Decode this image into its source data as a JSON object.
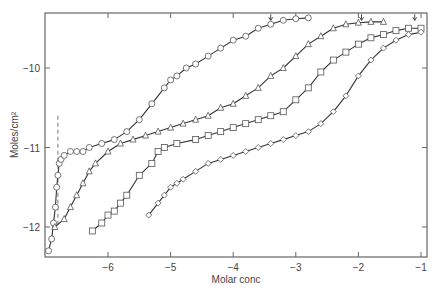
{
  "chart_data": {
    "type": "scatter",
    "title": "",
    "xlabel": "Molar conc",
    "ylabel": "Moles/cm²",
    "xlim": [
      -7.0,
      -0.9
    ],
    "ylim": [
      -12.35,
      -9.35
    ],
    "xticks": [
      -6,
      -5,
      -4,
      -3,
      -2,
      -1
    ],
    "xtick_labels": [
      "−6",
      "−5",
      "−4",
      "−3",
      "−2",
      "−1"
    ],
    "yticks": [
      -10,
      -11,
      -12
    ],
    "ytick_labels": [
      "−10",
      "−11",
      "−12"
    ],
    "grid": false,
    "legend": null,
    "annotations": [
      {
        "type": "dashed-vertical-line",
        "x": -6.8,
        "y_from": -10.6,
        "y_to": -12.0
      },
      {
        "type": "arrow-down",
        "x": -3.4,
        "y": -9.4
      },
      {
        "type": "arrow-down",
        "x": -1.95,
        "y": -9.4
      },
      {
        "type": "arrow-down",
        "x": -1.1,
        "y": -9.4
      }
    ],
    "series": [
      {
        "name": "series-1",
        "marker": "circle",
        "x": [
          -6.95,
          -6.9,
          -6.87,
          -6.84,
          -6.82,
          -6.8,
          -6.78,
          -6.75,
          -6.7,
          -6.6,
          -6.5,
          -6.4,
          -6.3,
          -6.1,
          -5.9,
          -5.7,
          -5.5,
          -5.3,
          -5.1,
          -5.0,
          -4.9,
          -4.75,
          -4.6,
          -4.4,
          -4.2,
          -4.0,
          -3.8,
          -3.6,
          -3.4,
          -3.2,
          -3.0,
          -2.8
        ],
        "y": [
          -12.3,
          -12.15,
          -11.95,
          -11.75,
          -11.5,
          -11.35,
          -11.2,
          -11.15,
          -11.1,
          -11.05,
          -11.05,
          -11.05,
          -11.0,
          -10.95,
          -10.9,
          -10.8,
          -10.65,
          -10.45,
          -10.25,
          -10.15,
          -10.1,
          -10.0,
          -9.95,
          -9.85,
          -9.75,
          -9.65,
          -9.6,
          -9.5,
          -9.45,
          -9.4,
          -9.38,
          -9.37
        ]
      },
      {
        "name": "series-2",
        "marker": "triangle",
        "x": [
          -6.85,
          -6.7,
          -6.6,
          -6.5,
          -6.4,
          -6.3,
          -6.2,
          -6.0,
          -5.8,
          -5.6,
          -5.4,
          -5.2,
          -5.0,
          -4.8,
          -4.6,
          -4.4,
          -4.2,
          -4.0,
          -3.8,
          -3.6,
          -3.4,
          -3.2,
          -3.0,
          -2.8,
          -2.6,
          -2.4,
          -2.2,
          -2.0,
          -1.8,
          -1.6
        ],
        "y": [
          -12.0,
          -11.9,
          -11.75,
          -11.6,
          -11.45,
          -11.3,
          -11.2,
          -11.05,
          -10.95,
          -10.9,
          -10.85,
          -10.8,
          -10.75,
          -10.7,
          -10.65,
          -10.6,
          -10.5,
          -10.45,
          -10.35,
          -10.25,
          -10.1,
          -10.0,
          -9.85,
          -9.7,
          -9.6,
          -9.5,
          -9.45,
          -9.43,
          -9.42,
          -9.42
        ]
      },
      {
        "name": "series-3",
        "marker": "square",
        "x": [
          -6.25,
          -6.1,
          -6.0,
          -5.9,
          -5.8,
          -5.7,
          -5.5,
          -5.3,
          -5.2,
          -5.1,
          -4.9,
          -4.6,
          -4.4,
          -4.2,
          -4.0,
          -3.8,
          -3.6,
          -3.4,
          -3.2,
          -3.0,
          -2.8,
          -2.6,
          -2.4,
          -2.2,
          -2.0,
          -1.8,
          -1.6,
          -1.4,
          -1.2,
          -1.0
        ],
        "y": [
          -12.05,
          -11.95,
          -11.85,
          -11.8,
          -11.7,
          -11.6,
          -11.35,
          -11.2,
          -11.05,
          -11.0,
          -10.95,
          -10.9,
          -10.85,
          -10.8,
          -10.75,
          -10.7,
          -10.65,
          -10.6,
          -10.55,
          -10.4,
          -10.25,
          -10.05,
          -9.9,
          -9.8,
          -9.7,
          -9.62,
          -9.58,
          -9.53,
          -9.5,
          -9.5
        ]
      },
      {
        "name": "series-4",
        "marker": "diamond",
        "x": [
          -5.35,
          -5.2,
          -5.1,
          -5.0,
          -4.9,
          -4.8,
          -4.6,
          -4.4,
          -4.2,
          -4.0,
          -3.8,
          -3.6,
          -3.4,
          -3.2,
          -3.0,
          -2.8,
          -2.6,
          -2.4,
          -2.2,
          -2.0,
          -1.8,
          -1.6,
          -1.4,
          -1.2,
          -1.0
        ],
        "y": [
          -11.85,
          -11.7,
          -11.6,
          -11.5,
          -11.45,
          -11.4,
          -11.3,
          -11.2,
          -11.15,
          -11.1,
          -11.05,
          -11.0,
          -10.95,
          -10.9,
          -10.85,
          -10.8,
          -10.7,
          -10.55,
          -10.35,
          -10.1,
          -9.9,
          -9.75,
          -9.65,
          -9.58,
          -9.55
        ]
      }
    ]
  },
  "layout": {
    "colors": {
      "axis": "#666666",
      "curve": "#333333",
      "marker_stroke": "#555555",
      "marker_fill": "#ffffff"
    }
  }
}
